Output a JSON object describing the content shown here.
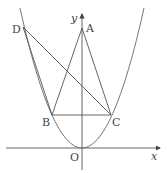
{
  "diagram": {
    "type": "coordinate-geometry",
    "axes": {
      "x_label": "x",
      "y_label": "y",
      "origin_label": "O"
    },
    "points": {
      "A": {
        "label": "A",
        "px": [
          82,
          28
        ]
      },
      "B": {
        "label": "B",
        "px": [
          52,
          115
        ]
      },
      "C": {
        "label": "C",
        "px": [
          111,
          115
        ]
      },
      "D": {
        "label": "D",
        "px": [
          23,
          27
        ]
      },
      "O": {
        "label": "O",
        "px": [
          82,
          148
        ]
      }
    },
    "segments": [
      [
        "A",
        "B"
      ],
      [
        "A",
        "C"
      ],
      [
        "B",
        "C"
      ],
      [
        "D",
        "B"
      ],
      [
        "D",
        "C"
      ]
    ],
    "colors": {
      "stroke": "#555555",
      "text": "#444444"
    }
  }
}
